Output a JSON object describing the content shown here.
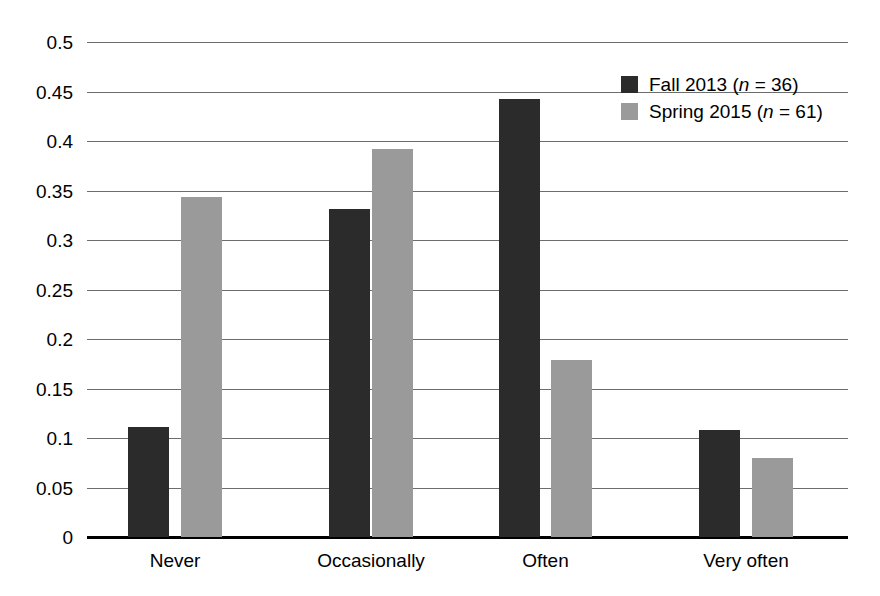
{
  "chart_data": {
    "type": "bar",
    "title": "",
    "subtitle": "",
    "xlabel": "",
    "ylabel": "",
    "categories": [
      "Never",
      "Occasionally",
      "Often",
      "Very often"
    ],
    "series": [
      {
        "name": "Fall 2013 (n = 36)",
        "name_prefix": "Fall 2013 (",
        "name_italic": "n",
        "name_suffix": " = 36)",
        "color": "#2b2b2b",
        "values": [
          0.111,
          0.331,
          0.442,
          0.108
        ]
      },
      {
        "name": "Spring 2015 (n = 61)",
        "name_prefix": "Spring 2015 (",
        "name_italic": "n",
        "name_suffix": " = 61)",
        "color": "#9a9a9a",
        "values": [
          0.343,
          0.392,
          0.179,
          0.08
        ]
      }
    ],
    "ylim": [
      0,
      0.5
    ],
    "ytick_values": [
      0,
      0.05,
      0.1,
      0.15,
      0.2,
      0.25,
      0.3,
      0.35,
      0.4,
      0.45,
      0.5
    ],
    "ytick_labels": [
      "0",
      "0.05",
      "0.1",
      "0.15",
      "0.2",
      "0.25",
      "0.3",
      "0.35",
      "0.4",
      "0.45",
      "0.5"
    ],
    "grid": true,
    "grid_axis": "y",
    "legend_position": "top-right",
    "background_color": "#ffffff",
    "axis_color": "#000000",
    "gridline_color": "#6d6d6d"
  }
}
